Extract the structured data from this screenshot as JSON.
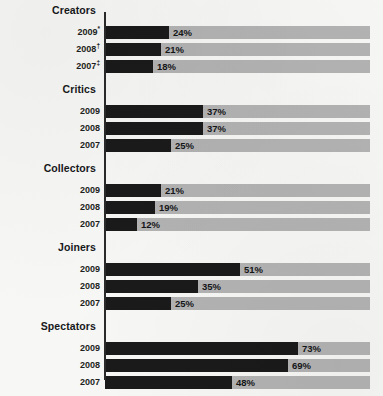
{
  "chart_data": {
    "type": "bar",
    "title": "",
    "subtitle": "",
    "xlabel": "",
    "ylabel": "",
    "xlim": [
      0,
      100
    ],
    "grid": false,
    "legend": "none",
    "orientation": "horizontal",
    "value_suffix": "%",
    "track_max_label": "100%",
    "groups": [
      {
        "label": "Creators",
        "rows": [
          {
            "year": "2009",
            "marker": "*",
            "value": 24,
            "value_label": "24%"
          },
          {
            "year": "2008",
            "marker": "†",
            "value": 21,
            "value_label": "21%"
          },
          {
            "year": "2007",
            "marker": "‡",
            "value": 18,
            "value_label": "18%"
          }
        ]
      },
      {
        "label": "Critics",
        "rows": [
          {
            "year": "2009",
            "marker": "",
            "value": 37,
            "value_label": "37%"
          },
          {
            "year": "2008",
            "marker": "",
            "value": 37,
            "value_label": "37%"
          },
          {
            "year": "2007",
            "marker": "",
            "value": 25,
            "value_label": "25%"
          }
        ]
      },
      {
        "label": "Collectors",
        "rows": [
          {
            "year": "2009",
            "marker": "",
            "value": 21,
            "value_label": "21%"
          },
          {
            "year": "2008",
            "marker": "",
            "value": 19,
            "value_label": "19%"
          },
          {
            "year": "2007",
            "marker": "",
            "value": 12,
            "value_label": "12%"
          }
        ]
      },
      {
        "label": "Joiners",
        "rows": [
          {
            "year": "2009",
            "marker": "",
            "value": 51,
            "value_label": "51%"
          },
          {
            "year": "2008",
            "marker": "",
            "value": 35,
            "value_label": "35%"
          },
          {
            "year": "2007",
            "marker": "",
            "value": 25,
            "value_label": "25%"
          }
        ]
      },
      {
        "label": "Spectators",
        "rows": [
          {
            "year": "2009",
            "marker": "",
            "value": 73,
            "value_label": "73%"
          },
          {
            "year": "2008",
            "marker": "",
            "value": 69,
            "value_label": "69%"
          },
          {
            "year": "2007",
            "marker": "",
            "value": 48,
            "value_label": "48%"
          }
        ]
      },
      {
        "label": "Inactives",
        "rows": [
          {
            "year": "2009",
            "marker": "",
            "value": 18,
            "value_label": "18%"
          },
          {
            "year": "2008",
            "marker": "",
            "value": 25,
            "value_label": "25%"
          },
          {
            "year": "2007",
            "marker": "",
            "value": 44,
            "value_label": "44%"
          }
        ]
      }
    ]
  },
  "style": {
    "bar_color": "#1a1a1a",
    "track_color": "#b3b3b3",
    "background_color": "#f7f7f5",
    "axis_color": "#2a2a2a",
    "text_color": "#16181a"
  },
  "layout": {
    "axis_x": 104,
    "track_x": 105,
    "track_width": 265,
    "bar_height": 13,
    "row_gap": 4,
    "group_header_height": 22,
    "first_group_top": 4
  }
}
